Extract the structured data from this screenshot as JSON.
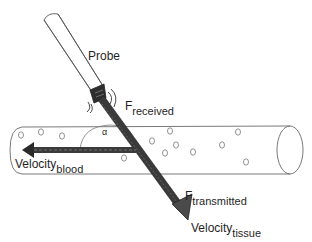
{
  "diagram": {
    "labels": {
      "probe": "Probe",
      "f_received_main": "F",
      "f_received_sub": "received",
      "alpha": "α",
      "velocity_blood_main": "Velocity",
      "velocity_blood_sub": "blood",
      "f_transmitted_main": "F",
      "f_transmitted_sub": "transmitted",
      "velocity_tissue_main": "Velocity",
      "velocity_tissue_sub": "tissue"
    },
    "colors": {
      "outline": "#555555",
      "arrow_fill": "#3a3a3a",
      "background": "#ffffff"
    }
  }
}
